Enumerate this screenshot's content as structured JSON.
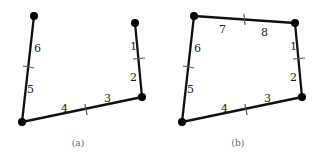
{
  "panels": [
    {
      "caption": "(a)",
      "labels": [
        "1",
        "2",
        "3",
        "4",
        "5",
        "6"
      ]
    },
    {
      "caption": "(b)",
      "labels": [
        "1",
        "2",
        "3",
        "4",
        "5",
        "6",
        "7",
        "8"
      ]
    }
  ],
  "colors": {
    "edge": "#111111",
    "tick": "#555555",
    "vertex": "#000000"
  }
}
